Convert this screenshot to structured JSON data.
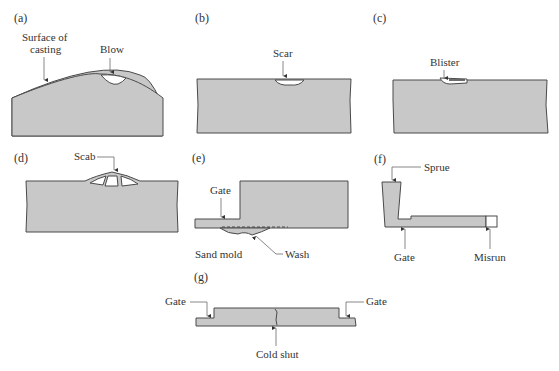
{
  "figure": {
    "colors": {
      "casting_fill": "#c8c8c8",
      "outline": "#4a4a4a",
      "text": "#333333",
      "background": "#ffffff"
    },
    "panels": [
      {
        "id": "a",
        "label": "(a)",
        "annotations": [
          "Surface of",
          "casting",
          "Blow"
        ]
      },
      {
        "id": "b",
        "label": "(b)",
        "annotations": [
          "Scar"
        ]
      },
      {
        "id": "c",
        "label": "(c)",
        "annotations": [
          "Blister"
        ]
      },
      {
        "id": "d",
        "label": "(d)",
        "annotations": [
          "Scab"
        ]
      },
      {
        "id": "e",
        "label": "(e)",
        "annotations": [
          "Gate",
          "Sand mold",
          "Wash"
        ]
      },
      {
        "id": "f",
        "label": "(f)",
        "annotations": [
          "Sprue",
          "Gate",
          "Misrun"
        ]
      },
      {
        "id": "g",
        "label": "(g)",
        "annotations": [
          "Gate",
          "Gate",
          "Cold shut"
        ]
      }
    ]
  }
}
